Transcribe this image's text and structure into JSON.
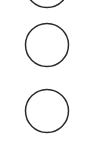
{
  "canvas": {
    "width": 94,
    "height": 148,
    "background_color": "#ffffff",
    "title": "Vertical circle column"
  },
  "style": {
    "stroke_color": "#2b2b2b",
    "stroke_width": 1.5,
    "fill": "none"
  },
  "shapes": [
    {
      "name": "circle-top-clipped",
      "type": "circle",
      "cx": 47,
      "cy": -14,
      "r": 21.5,
      "clipped": "top"
    },
    {
      "name": "circle-middle",
      "type": "circle",
      "cx": 47,
      "cy": 45,
      "r": 21.5,
      "clipped": "none"
    },
    {
      "name": "circle-bottom",
      "type": "circle",
      "cx": 47,
      "cy": 111,
      "r": 21.5,
      "clipped": "none"
    }
  ]
}
